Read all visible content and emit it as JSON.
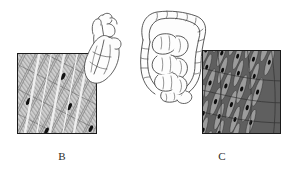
{
  "figure": {
    "background_color": "#ffffff",
    "panels": [
      {
        "id": "B",
        "label": "B",
        "micrograph_name": "cardiac-muscle-micrograph",
        "tissue": "cardiac muscle",
        "organ_name": "heart",
        "organ_icon": "heart-organ-icon",
        "border_color": "#1b1b1b",
        "tissue_base_color": "#b5b5b5",
        "fiber_color": "#d8d8d8",
        "nucleus_color": "#141414",
        "striation_color": "#7c7c7c"
      },
      {
        "id": "C",
        "label": "C",
        "micrograph_name": "smooth-muscle-micrograph",
        "tissue": "smooth muscle",
        "organ_name": "intestines",
        "organ_icon": "intestine-organ-icon",
        "border_color": "#1b1b1b",
        "tissue_base_color": "#6f6f6f",
        "fiber_color": "#9d9d9d",
        "nucleus_color": "#0d0d0d",
        "striation_color": "#3a3a3a"
      }
    ],
    "line_art_color": "#3a3a3a",
    "line_art_fill": "#fdfdfd"
  }
}
